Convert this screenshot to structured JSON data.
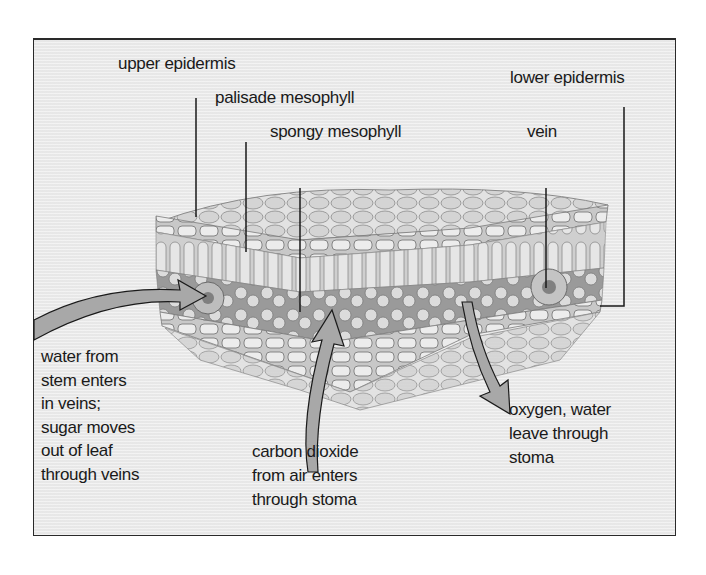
{
  "diagram": {
    "labels": {
      "upper_epidermis": "upper epidermis",
      "palisade_mesophyll": "palisade mesophyll",
      "spongy_mesophyll": "spongy mesophyll",
      "vein": "vein",
      "lower_epidermis": "lower epidermis"
    },
    "captions": {
      "water": [
        "water from",
        "stem enters",
        "in veins;",
        "sugar moves",
        "out of leaf",
        "through veins"
      ],
      "carbon_dioxide": [
        "carbon dioxide",
        "from air enters",
        "through stoma"
      ],
      "oxygen": [
        "oxygen, water",
        "leave through",
        "stoma"
      ]
    },
    "colors": {
      "background": "#ececec",
      "frame": "#2a2a2a",
      "leaf_cell": "#d9d9d9",
      "arrow_fill": "#a8a8a8",
      "text": "#1a1a1a"
    }
  }
}
